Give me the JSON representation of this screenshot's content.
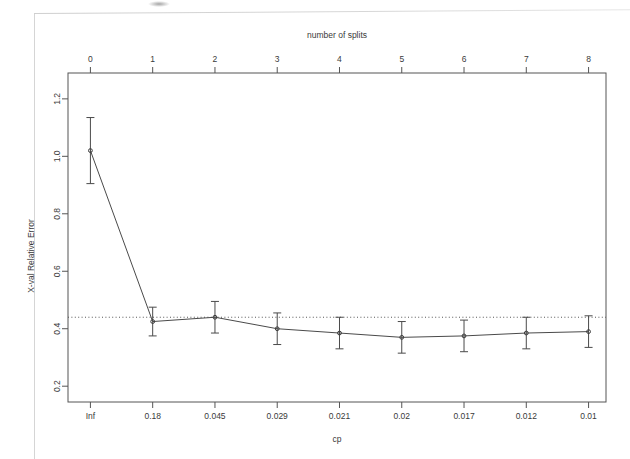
{
  "page": {
    "background": "#ffffff",
    "scan_artifact": true
  },
  "chart_data": {
    "type": "line",
    "title": "",
    "subtitle": "",
    "xlabel": "cp",
    "ylabel": "X-val Relative Error",
    "top_axis_label": "number of splits",
    "top_axis_ticks": [
      "0",
      "1",
      "2",
      "3",
      "4",
      "5",
      "6",
      "7",
      "8"
    ],
    "categories": [
      "Inf",
      "0.18",
      "0.045",
      "0.029",
      "0.021",
      "0.02",
      "0.017",
      "0.012",
      "0.01"
    ],
    "x": [
      0,
      1,
      2,
      3,
      4,
      5,
      6,
      7,
      8
    ],
    "values": [
      1.02,
      0.425,
      0.44,
      0.4,
      0.385,
      0.37,
      0.375,
      0.385,
      0.39
    ],
    "error_low": [
      0.905,
      0.375,
      0.385,
      0.345,
      0.33,
      0.315,
      0.32,
      0.33,
      0.335
    ],
    "error_high": [
      1.135,
      0.475,
      0.495,
      0.455,
      0.44,
      0.425,
      0.43,
      0.44,
      0.445
    ],
    "reference_line": 0.44,
    "reference_line_style": "dotted",
    "ytick_labels": [
      "0.2",
      "0.4",
      "0.6",
      "0.8",
      "1.0",
      "1.2"
    ],
    "ytick_values": [
      0.2,
      0.4,
      0.6,
      0.8,
      1.0,
      1.2
    ],
    "ylim": [
      0.145,
      1.29
    ],
    "xlim": [
      -0.36,
      8.28
    ],
    "grid": false,
    "legend": null,
    "point_marker": "circle",
    "line_color": "#4a4a4a",
    "axis_color": "#555555"
  }
}
